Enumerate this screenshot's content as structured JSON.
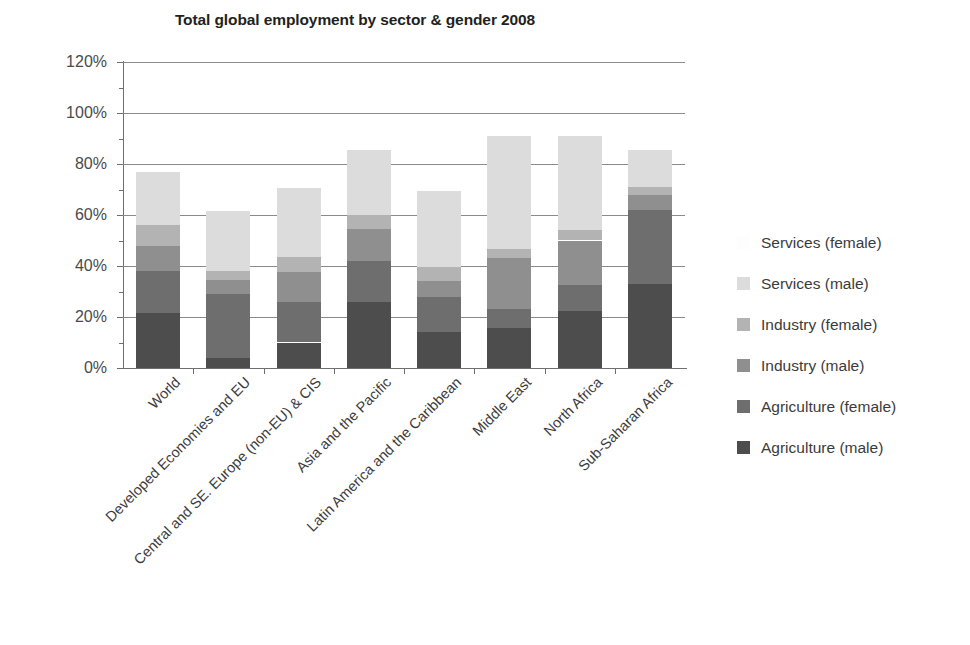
{
  "chart_data": {
    "type": "bar",
    "subtype": "stacked-bar-percent",
    "title": "Total global employment by sector & gender 2008",
    "xlabel": "",
    "ylabel": "",
    "ylim": [
      0,
      120
    ],
    "ytick_values": [
      0,
      20,
      40,
      60,
      80,
      100,
      120
    ],
    "ytick_labels": [
      "0%",
      "20%",
      "40%",
      "60%",
      "80%",
      "100%",
      "120%"
    ],
    "grid": "horizontal",
    "legend_position": "right",
    "legend_order_top_to_bottom": [
      "Services (female)",
      "Services (male)",
      "Industry (female)",
      "Industry (male)",
      "Agriculture (female)",
      "Agriculture (male)"
    ],
    "categories": [
      "World",
      "Developed Economies and EU",
      "Central and SE. Europe (non-EU) & CIS",
      "Asia and the Pacific",
      "Latin America and the Caribbean",
      "Middle East",
      "North Africa",
      "Sub-Saharan Africa"
    ],
    "series": [
      {
        "name": "Agriculture (male)",
        "color": "#4d4d4d",
        "values": [
          21.5,
          4.0,
          10.0,
          26.0,
          14.0,
          15.5,
          22.5,
          33.0
        ]
      },
      {
        "name": "Agriculture (female)",
        "color": "#6e6e6e",
        "values": [
          16.5,
          25.0,
          16.0,
          16.0,
          14.0,
          7.5,
          10.0,
          29.0
        ]
      },
      {
        "name": "Industry (male)",
        "color": "#8f8f8f",
        "values": [
          10.0,
          5.5,
          11.5,
          12.5,
          6.0,
          20.0,
          17.5,
          6.0
        ]
      },
      {
        "name": "Industry (female)",
        "color": "#b3b3b3",
        "values": [
          8.0,
          3.5,
          6.0,
          5.5,
          5.5,
          3.5,
          4.0,
          3.0
        ]
      },
      {
        "name": "Services (male)",
        "color": "#dcdcdc",
        "values": [
          21.0,
          23.5,
          27.0,
          25.5,
          30.0,
          44.5,
          37.0,
          14.5
        ]
      },
      {
        "name": "Services (female)",
        "color": "#fbfbfb",
        "values": [
          0.0,
          0.0,
          0.0,
          0.0,
          0.0,
          0.0,
          0.0,
          0.0
        ]
      }
    ],
    "totals": [
      77.0,
      61.5,
      70.5,
      85.5,
      69.5,
      91.0,
      91.0,
      85.5
    ]
  },
  "legend": {
    "items": [
      {
        "label": "Services (female)",
        "color": "#fdfdfd"
      },
      {
        "label": "Services (male)",
        "color": "#dcdcdc"
      },
      {
        "label": "Industry (female)",
        "color": "#b3b3b3"
      },
      {
        "label": "Industry (male)",
        "color": "#8f8f8f"
      },
      {
        "label": "Agriculture (female)",
        "color": "#6e6e6e"
      },
      {
        "label": "Agriculture (male)",
        "color": "#4d4d4d"
      }
    ]
  },
  "colors": {
    "axis": "#6f6f6f",
    "gridline": "#8a8a8a",
    "title": "#231f20",
    "text": "#3b3b3b",
    "background": "#ffffff"
  }
}
